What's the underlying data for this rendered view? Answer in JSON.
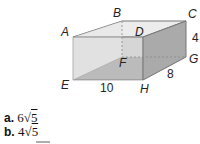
{
  "figure": {
    "type": "rectangular-prism",
    "vertices": {
      "A": "A",
      "B": "B",
      "C": "C",
      "D": "D",
      "E": "E",
      "F": "F",
      "G": "G",
      "H": "H"
    },
    "dimensions": {
      "length": "10",
      "width": "8",
      "height": "4"
    }
  },
  "options": [
    {
      "letter": "a.",
      "coef": "6",
      "radical": "√",
      "radicand": "5"
    },
    {
      "letter": "b.",
      "coef": "4",
      "radical": "√",
      "radicand": "5"
    }
  ]
}
